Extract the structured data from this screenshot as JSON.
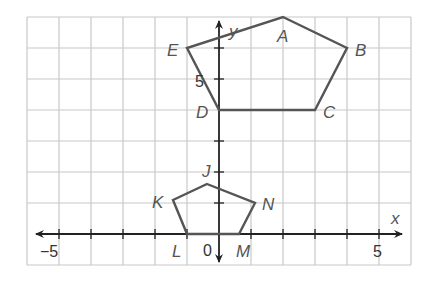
{
  "diagram": {
    "type": "coordinate-plane",
    "x_axis_label": "x",
    "y_axis_label": "y",
    "tick_labels": {
      "x_neg5": "−5",
      "x_5": "5",
      "y_5": "5",
      "origin": "0"
    },
    "x_range": [
      -6,
      6
    ],
    "y_range": [
      -1,
      7
    ],
    "grid": true,
    "colors": {
      "grid": "#c8c8c8",
      "axis": "#222222",
      "polygon": "#555555",
      "label": "#555555"
    },
    "polygons": [
      {
        "name": "ABCDE",
        "vertices": [
          {
            "label": "A",
            "x": 2,
            "y": 7
          },
          {
            "label": "B",
            "x": 4,
            "y": 6
          },
          {
            "label": "C",
            "x": 3,
            "y": 4
          },
          {
            "label": "D",
            "x": 0,
            "y": 4
          },
          {
            "label": "E",
            "x": -1,
            "y": 6
          }
        ]
      },
      {
        "name": "JKLMN",
        "vertices": [
          {
            "label": "J",
            "x": -0.4,
            "y": 1.6
          },
          {
            "label": "N",
            "x": 1.1,
            "y": 1
          },
          {
            "label": "M",
            "x": 0.6,
            "y": 0
          },
          {
            "label": "L",
            "x": -1,
            "y": 0
          },
          {
            "label": "K",
            "x": -1.5,
            "y": 1.1
          }
        ]
      }
    ],
    "point_labels": {
      "A": "A",
      "B": "B",
      "C": "C",
      "D": "D",
      "E": "E",
      "J": "J",
      "K": "K",
      "L": "L",
      "M": "M",
      "N": "N"
    }
  }
}
